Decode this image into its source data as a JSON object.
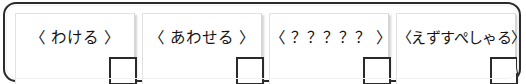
{
  "frame": {
    "border_color": "#2b2b2b",
    "background": "#ffffff"
  },
  "toolbar": {
    "name": "action-button-row",
    "buttons": [
      {
        "label": "〈 わける 〉",
        "name": "wakeru",
        "checkbox_checked": false
      },
      {
        "label": "〈 あわせる 〉",
        "name": "awaseru",
        "checkbox_checked": false
      },
      {
        "label": "〈 ？？？？？ 〉",
        "name": "unknown",
        "checkbox_checked": false
      },
      {
        "label": "〈えずすぺしゃる〉",
        "name": "ezu-special",
        "checkbox_checked": false
      }
    ]
  },
  "colors": {
    "panel_border": "#d6d6d6",
    "panel_background": "#ffffff",
    "text": "#141414",
    "square_border": "#2a2a2a"
  }
}
